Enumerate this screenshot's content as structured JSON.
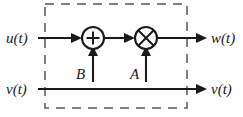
{
  "diagram": {
    "boundary": {
      "name": "system-boundary",
      "style": "dashed",
      "color": "#555555",
      "x": 45,
      "y": 4,
      "width": 142,
      "height": 104
    },
    "colors": {
      "wire": "#1a1a1a",
      "boundary": "#555555",
      "background": "#ffffff"
    },
    "signals": {
      "input_top": "u(t)",
      "input_bottom": "v(t)",
      "output_top": "w(t)",
      "output_bottom": "v(t)"
    },
    "gains": {
      "sum_input": "B",
      "product_input": "A"
    },
    "nodes": [
      {
        "name": "summing-junction",
        "symbol": "+",
        "cx": 93,
        "cy": 38,
        "r": 11
      },
      {
        "name": "multiplier-junction",
        "symbol": "⊗",
        "cx": 146,
        "cy": 38,
        "r": 11
      }
    ],
    "lines": {
      "top_y": 38,
      "bottom_y": 89
    }
  }
}
